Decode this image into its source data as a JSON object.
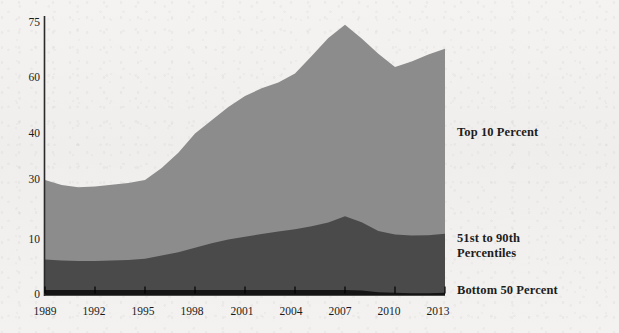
{
  "chart_data": {
    "type": "area",
    "stacked": true,
    "title": "",
    "subtitle": "",
    "xlabel": "",
    "ylabel": "",
    "grid": false,
    "legend_position": "right",
    "x": [
      1989,
      1990,
      1991,
      1992,
      1993,
      1994,
      1995,
      1996,
      1997,
      1998,
      1999,
      2000,
      2001,
      2002,
      2003,
      2004,
      2005,
      2006,
      2007,
      2008,
      2009,
      2010,
      2011,
      2012,
      2013
    ],
    "xtick_labels": [
      "1989",
      "1992",
      "1995",
      "1998",
      "2001",
      "2004",
      "2007",
      "2010",
      "2013"
    ],
    "xticks": [
      1989,
      1992,
      1995,
      1998,
      2001,
      2004,
      2007,
      2010,
      2013
    ],
    "ytick_labels": [
      "0",
      "10",
      "30",
      "40",
      "60",
      "75"
    ],
    "yticks": [
      0,
      10,
      30,
      40,
      60,
      75
    ],
    "ylim": [
      0,
      75
    ],
    "xlim": [
      1989,
      2013
    ],
    "series": [
      {
        "name": "Bottom 50 Percent",
        "color": "#151515",
        "values": [
          1.0,
          1.0,
          1.0,
          1.0,
          1.0,
          1.0,
          1.0,
          1.0,
          1.0,
          1.0,
          1.0,
          1.0,
          1.0,
          1.0,
          1.0,
          1.0,
          1.0,
          1.0,
          1.0,
          0.9,
          0.6,
          0.5,
          0.4,
          0.4,
          0.5
        ]
      },
      {
        "name": "51st to 90th Percentiles",
        "color": "#4a4a4a",
        "values": [
          5.5,
          5.3,
          5.2,
          5.2,
          5.3,
          5.4,
          5.6,
          6.2,
          6.8,
          7.6,
          8.4,
          9.2,
          10.1,
          11.0,
          11.8,
          12.6,
          13.6,
          14.8,
          16.9,
          15.0,
          12.4,
          11.3,
          11.1,
          11.2,
          11.6
        ]
      },
      {
        "name": "Top 10 Percent",
        "color": "#8c8c8c",
        "values": [
          23.5,
          22.0,
          21.4,
          21.6,
          22.1,
          22.6,
          23.4,
          25.4,
          28.1,
          31.6,
          35.5,
          39.4,
          42.5,
          44.3,
          45.6,
          47.6,
          51.4,
          55.1,
          56.6,
          54.9,
          53.6,
          51.2,
          53.0,
          54.8,
          55.9
        ]
      }
    ],
    "stack_tops": {
      "Bottom 50 Percent": [
        1.0,
        1.0,
        1.0,
        1.0,
        1.0,
        1.0,
        1.0,
        1.0,
        1.0,
        1.0,
        1.0,
        1.0,
        1.0,
        1.0,
        1.0,
        1.0,
        1.0,
        1.0,
        1.0,
        0.9,
        0.6,
        0.5,
        0.4,
        0.4,
        0.5
      ],
      "51st to 90th Percentiles": [
        6.5,
        6.3,
        6.2,
        6.2,
        6.3,
        6.4,
        6.6,
        7.2,
        7.8,
        8.6,
        9.4,
        10.2,
        11.1,
        12.0,
        12.8,
        13.6,
        14.6,
        15.8,
        17.9,
        15.9,
        13.0,
        11.8,
        11.5,
        11.6,
        12.1
      ],
      "Top 10 Percent": [
        30.0,
        28.3,
        27.6,
        27.8,
        28.4,
        29.0,
        30.0,
        32.6,
        35.9,
        40.2,
        44.9,
        49.6,
        53.6,
        56.3,
        58.4,
        61.2,
        66.0,
        70.9,
        74.5,
        70.8,
        66.6,
        63.0,
        64.5,
        66.4,
        68.0
      ]
    }
  },
  "axis": {
    "y_ticks": [
      {
        "label": "75",
        "value": 75
      },
      {
        "label": "60",
        "value": 60
      },
      {
        "label": "40",
        "value": 40
      },
      {
        "label": "30",
        "value": 30
      },
      {
        "label": "10",
        "value": 10
      },
      {
        "label": "0",
        "value": 0
      }
    ],
    "x_ticks": [
      {
        "label": "1989"
      },
      {
        "label": "1992"
      },
      {
        "label": "1995"
      },
      {
        "label": "1998"
      },
      {
        "label": "2001"
      },
      {
        "label": "2004"
      },
      {
        "label": "2007"
      },
      {
        "label": "2010"
      },
      {
        "label": "2013"
      }
    ]
  },
  "legend": {
    "top": {
      "line1": "Top 10 Percent"
    },
    "middle": {
      "line1": "51st to 90th",
      "line2": "Percentiles"
    },
    "bottom": {
      "line1": "Bottom 50 Percent"
    }
  },
  "colors": {
    "top_10": "#8c8c8c",
    "middle_40": "#4a4a4a",
    "bottom_50": "#151515",
    "axis": "#2a2a2a",
    "text": "#1b1b1b",
    "paper": "#f2f1ef"
  }
}
